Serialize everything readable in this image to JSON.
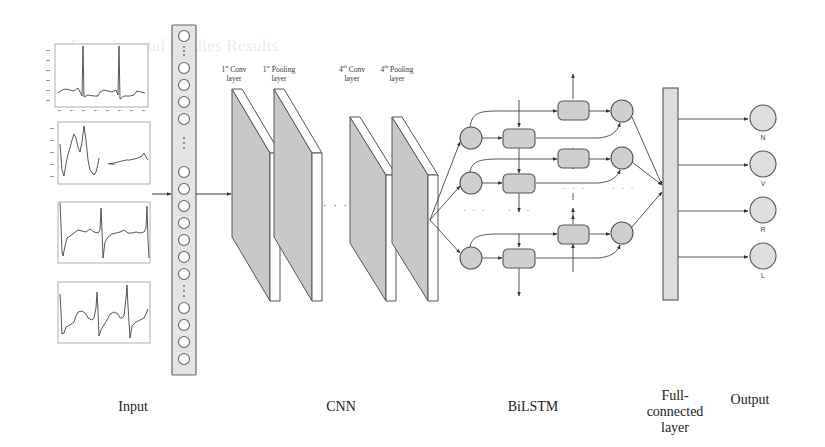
{
  "background_text": "Experimental Studies Results",
  "stages": {
    "input": "Input",
    "cnn": "CNN",
    "bilstm": "BiLSTM",
    "fc": "Full-connected layer",
    "output": "Output"
  },
  "cnn_layers": [
    {
      "ordinal": "1",
      "suffix": "st",
      "name": "Conv",
      "line2": "layer"
    },
    {
      "ordinal": "1",
      "suffix": "st",
      "name": "Pooling",
      "line2": "layer"
    },
    {
      "ordinal": "4",
      "suffix": "th",
      "name": "Conv",
      "line2": "layer"
    },
    {
      "ordinal": "4",
      "suffix": "th",
      "name": "Pooling",
      "line2": "layer"
    }
  ],
  "cnn_ellipsis": "· · ·",
  "outputs": [
    {
      "label": "N"
    },
    {
      "label": "V"
    },
    {
      "label": "R"
    },
    {
      "label": "L"
    }
  ],
  "input_signals": [
    {
      "name": "ecg-normal"
    },
    {
      "name": "ecg-ventricular"
    },
    {
      "name": "ecg-rbbb"
    },
    {
      "name": "ecg-lbbb"
    }
  ],
  "colors": {
    "fill_gray": "#cfcfcf",
    "stroke": "#555555",
    "panel_fill": "#e4e4e4"
  }
}
